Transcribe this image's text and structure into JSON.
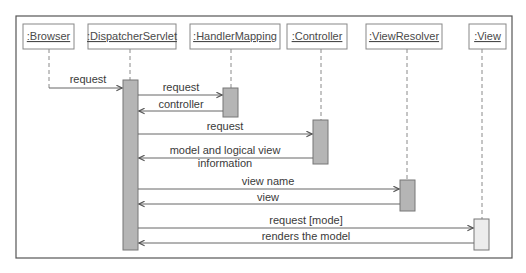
{
  "diagram": {
    "type": "uml-sequence",
    "colors": {
      "frame": "#555555",
      "box_border": "#888888",
      "lifeline": "#8a8a8a",
      "activation_fill": "#b5b5b5",
      "activation_light_fill": "#ececec",
      "arrow": "#666666",
      "text": "#3a3a3a"
    },
    "participants": [
      {
        "id": "browser",
        "label": ":Browser",
        "x": 49
      },
      {
        "id": "dispatcher",
        "label": ":DispatcherServlet",
        "x": 130
      },
      {
        "id": "handler",
        "label": ":HandlerMapping",
        "x": 231
      },
      {
        "id": "controller",
        "label": ":Controller",
        "x": 321
      },
      {
        "id": "resolver",
        "label": ":ViewResolver",
        "x": 407
      },
      {
        "id": "view",
        "label": ":View",
        "x": 482
      }
    ],
    "messages": [
      {
        "from": "browser",
        "to": "dispatcher",
        "label": "request",
        "type": "call"
      },
      {
        "from": "dispatcher",
        "to": "handler",
        "label": "request",
        "type": "call"
      },
      {
        "from": "handler",
        "to": "dispatcher",
        "label": "controller",
        "type": "return"
      },
      {
        "from": "dispatcher",
        "to": "controller",
        "label": "request",
        "type": "call"
      },
      {
        "from": "controller",
        "to": "dispatcher",
        "label": "model and logical view",
        "label2": "information",
        "type": "return"
      },
      {
        "from": "dispatcher",
        "to": "resolver",
        "label": "view name",
        "type": "call"
      },
      {
        "from": "resolver",
        "to": "dispatcher",
        "label": "view",
        "type": "return"
      },
      {
        "from": "dispatcher",
        "to": "view",
        "label": "request [mode]",
        "type": "call"
      },
      {
        "from": "view",
        "to": "dispatcher",
        "label": "renders the model",
        "type": "return"
      }
    ]
  }
}
